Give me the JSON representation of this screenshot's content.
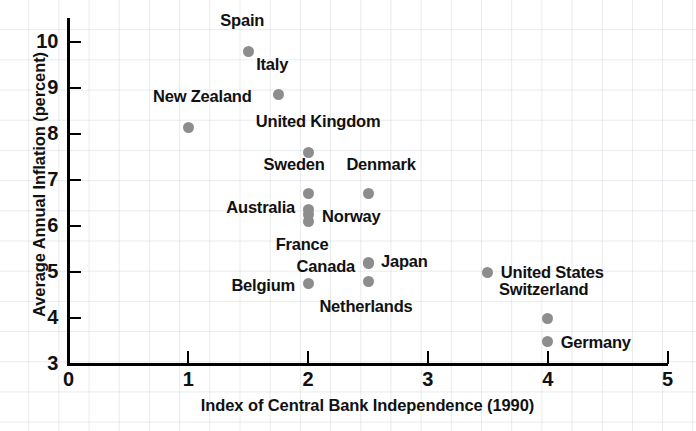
{
  "chart_data": {
    "type": "scatter",
    "title": "",
    "xlabel": "Index of Central Bank Independence (1990)",
    "ylabel": "Average Annual Inflation (percent)",
    "xlim": [
      0,
      5
    ],
    "ylim": [
      3,
      10
    ],
    "xticks": [
      0,
      1,
      2,
      3,
      4,
      5
    ],
    "yticks": [
      3,
      4,
      5,
      6,
      7,
      8,
      9,
      10
    ],
    "xtick_labels": [
      "0",
      "1",
      "2",
      "3",
      "4",
      "5"
    ],
    "ytick_labels": [
      "3",
      "4",
      "5",
      "6",
      "7",
      "8",
      "9",
      "10"
    ],
    "grid": true,
    "legend": "none",
    "marker_color": "#8d8d8d",
    "points": [
      {
        "label": "Spain",
        "x": 1.5,
        "y": 9.8,
        "label_dx": -6,
        "label_dy": -30,
        "anchor": "middle"
      },
      {
        "label": "Italy",
        "x": 1.75,
        "y": 8.85,
        "label_dx": -6,
        "label_dy": -30,
        "anchor": "middle"
      },
      {
        "label": "New Zealand",
        "x": 1.0,
        "y": 8.15,
        "label_dx": 14,
        "label_dy": -30,
        "anchor": "middle"
      },
      {
        "label": "United Kingdom",
        "x": 2.0,
        "y": 7.6,
        "label_dx": 10,
        "label_dy": -30,
        "anchor": "middle"
      },
      {
        "label": "Sweden",
        "x": 2.0,
        "y": 6.7,
        "label_dx": -14,
        "label_dy": -29,
        "anchor": "middle"
      },
      {
        "label": "Denmark",
        "x": 2.5,
        "y": 6.7,
        "label_dx": 13,
        "label_dy": -29,
        "anchor": "middle"
      },
      {
        "label": "Australia",
        "x": 2.0,
        "y": 6.35,
        "label_dx": -13,
        "label_dy": -2,
        "anchor": "end"
      },
      {
        "label": "Norway",
        "x": 2.0,
        "y": 6.25,
        "label_dx": 14,
        "label_dy": 2,
        "anchor": "start"
      },
      {
        "label": "France",
        "x": 2.0,
        "y": 6.1,
        "label_dx": -6,
        "label_dy": 24,
        "anchor": "middle"
      },
      {
        "label": "Japan",
        "x": 2.5,
        "y": 5.2,
        "label_dx": 13,
        "label_dy": -1,
        "anchor": "start"
      },
      {
        "label": "Canada",
        "x": 2.5,
        "y": 5.18,
        "label_dx": -13,
        "label_dy": 3,
        "anchor": "end"
      },
      {
        "label": "United States",
        "x": 3.5,
        "y": 5.0,
        "label_dx": 13,
        "label_dy": 1,
        "anchor": "start"
      },
      {
        "label": "Belgium",
        "x": 2.0,
        "y": 4.75,
        "label_dx": -13,
        "label_dy": 2,
        "anchor": "end"
      },
      {
        "label": "Netherlands",
        "x": 2.5,
        "y": 4.8,
        "label_dx": -2,
        "label_dy": 26,
        "anchor": "middle"
      },
      {
        "label": "Switzerland",
        "x": 4.0,
        "y": 4.0,
        "label_dx": -4,
        "label_dy": -28,
        "anchor": "middle"
      },
      {
        "label": "Germany",
        "x": 4.0,
        "y": 3.5,
        "label_dx": 13,
        "label_dy": 2,
        "anchor": "start"
      }
    ]
  }
}
